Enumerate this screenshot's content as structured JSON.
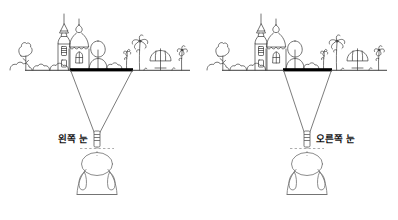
{
  "figure": {
    "title": "",
    "type": "stereoscopic-vision-diagram"
  },
  "panels": [
    {
      "id": "left-panel",
      "eye_label": "왼쪽 눈",
      "eye_side": "left",
      "label_position": "left-of-eye",
      "window_bar": {
        "x1": 70,
        "x2": 133,
        "y": 70
      },
      "horizon": {
        "x1": 25,
        "x2": 190,
        "y": 70
      },
      "eye": {
        "x": 97,
        "y": 139
      },
      "person": {
        "cx": 97,
        "cy": 185
      }
    },
    {
      "id": "right-panel",
      "eye_label": "오른쪽 눈",
      "eye_side": "right",
      "label_position": "right-of-eye",
      "window_bar": {
        "x1": 283,
        "x2": 332,
        "y": 70
      },
      "horizon": {
        "x1": 222,
        "x2": 387,
        "y": 70
      },
      "eye": {
        "x": 307,
        "y": 139
      },
      "person": {
        "cx": 307,
        "cy": 185
      }
    }
  ],
  "scene": {
    "elements": [
      "tree-left",
      "bushes",
      "church-with-spire",
      "domed-building",
      "round-tree",
      "palm-tree-small",
      "palm-tree-large",
      "beach-umbrella",
      "palm-tree-right"
    ]
  },
  "colors": {
    "ink": "#1a1a1a",
    "line": "#3a3a3a",
    "bar": "#000000",
    "background": "#ffffff"
  }
}
